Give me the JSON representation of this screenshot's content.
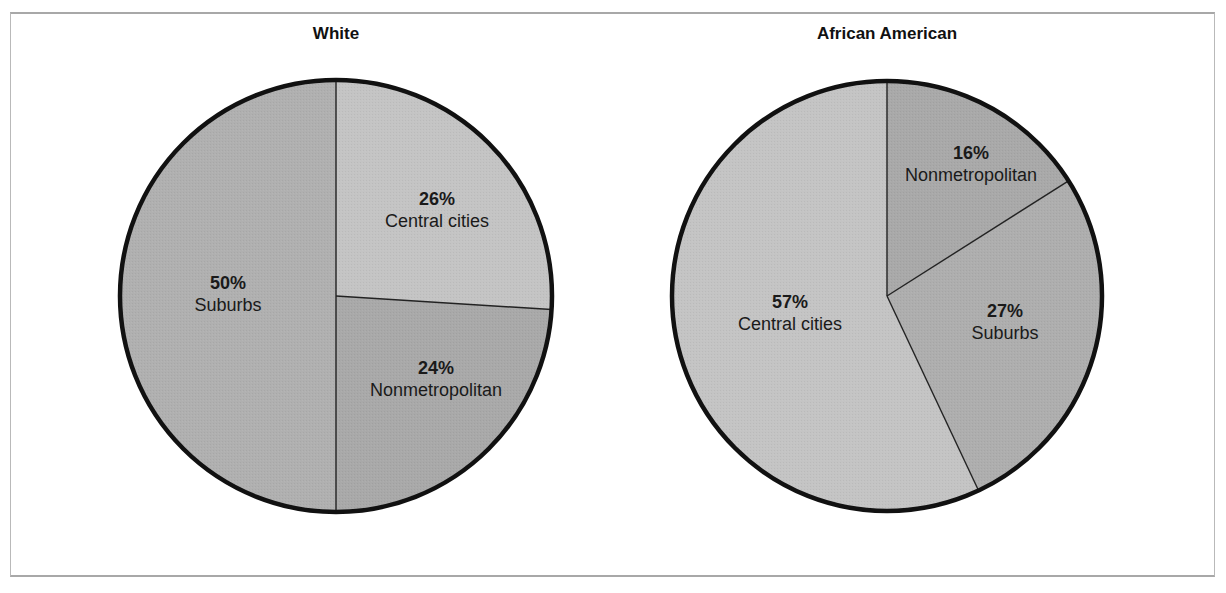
{
  "chart_data": [
    {
      "type": "pie",
      "title": "White",
      "categories": [
        "Central cities",
        "Nonmetropolitan",
        "Suburbs"
      ],
      "values": [
        26,
        24,
        50
      ],
      "unit": "%",
      "start_angle_deg": 0,
      "direction": "clockwise-from-top",
      "colors": [
        "#c4c4c4",
        "#a9a9a9",
        "#b0b0b0"
      ],
      "legend": "none (inline labels)"
    },
    {
      "type": "pie",
      "title": "African American",
      "categories": [
        "Nonmetropolitan",
        "Suburbs",
        "Central cities"
      ],
      "values": [
        16,
        27,
        57
      ],
      "unit": "%",
      "start_angle_deg": 0,
      "direction": "clockwise-from-top",
      "colors": [
        "#a9a9a9",
        "#aeaeae",
        "#c4c4c4"
      ],
      "legend": "none (inline labels)"
    }
  ],
  "charts": {
    "white": {
      "title": "White",
      "labels": [
        {
          "pct": "26%",
          "cat": "Central cities"
        },
        {
          "pct": "24%",
          "cat": "Nonmetropolitan"
        },
        {
          "pct": "50%",
          "cat": "Suburbs"
        }
      ]
    },
    "african_american": {
      "title": "African American",
      "labels": [
        {
          "pct": "16%",
          "cat": "Nonmetropolitan"
        },
        {
          "pct": "27%",
          "cat": "Suburbs"
        },
        {
          "pct": "57%",
          "cat": "Central cities"
        }
      ]
    }
  },
  "colors": {
    "outline": "#111111",
    "divider": "#222222",
    "frame": "#b0b0b0",
    "light_slice": "#c4c4c4",
    "dark_slice": "#a9a9a9"
  }
}
